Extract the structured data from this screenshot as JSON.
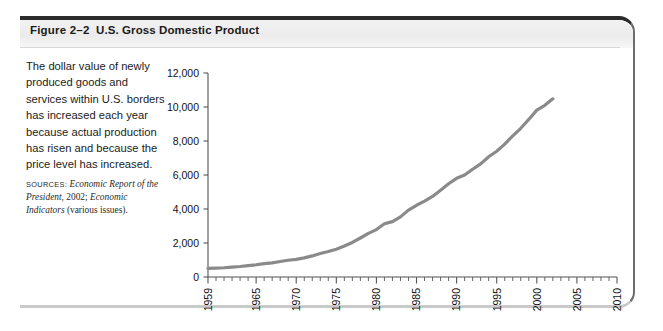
{
  "figure": {
    "number_label": "Figure 2–2",
    "title": "U.S. Gross Domestic Product",
    "caption": "The dollar value of newly produced goods and services within U.S. borders has increased each year because actual production has risen and because the price level has increased.",
    "sources_label": "SOURCES:",
    "sources_text_1": "Economic Report of the President",
    "sources_text_2": ", 2002; ",
    "sources_text_3": "Economic Indicators",
    "sources_text_4": " (various issues)."
  },
  "colors": {
    "line": "#8a8a8a",
    "axis": "#555555",
    "frame_top": "#2b2b2b",
    "header_band": "#efefef",
    "text": "#1a1a1a"
  },
  "chart_data": {
    "type": "line",
    "title": "U.S. Gross Domestic Product",
    "xlabel": "",
    "ylabel": "",
    "ylim": [
      0,
      12000
    ],
    "xlim": [
      1959,
      2010
    ],
    "grid": false,
    "legend": "none",
    "ytick_labels": [
      "12,000",
      "10,000",
      "8,000",
      "6,000",
      "4,000",
      "2,000",
      "0"
    ],
    "ytick_values": [
      12000,
      10000,
      8000,
      6000,
      4000,
      2000,
      0
    ],
    "xtick_labels": [
      "1959",
      "1965",
      "1970",
      "1975",
      "1980",
      "1985",
      "1990",
      "1995",
      "2000",
      "2005",
      "2010"
    ],
    "xtick_values": [
      1959,
      1965,
      1970,
      1975,
      1980,
      1985,
      1990,
      1995,
      2000,
      2005,
      2010
    ],
    "minor_tick_interval": 1,
    "series": [
      {
        "name": "GDP (billions of dollars)",
        "x": [
          1959,
          1960,
          1961,
          1962,
          1963,
          1964,
          1965,
          1966,
          1967,
          1968,
          1969,
          1970,
          1971,
          1972,
          1973,
          1974,
          1975,
          1976,
          1977,
          1978,
          1979,
          1980,
          1981,
          1982,
          1983,
          1984,
          1985,
          1986,
          1987,
          1988,
          1989,
          1990,
          1991,
          1992,
          1993,
          1994,
          1995,
          1996,
          1997,
          1998,
          1999,
          2000,
          2001,
          2002
        ],
        "values": [
          507,
          527,
          545,
          586,
          618,
          664,
          720,
          788,
          833,
          910,
          985,
          1039,
          1128,
          1240,
          1386,
          1501,
          1635,
          1824,
          2031,
          2295,
          2563,
          2790,
          3128,
          3255,
          3537,
          3933,
          4220,
          4463,
          4740,
          5104,
          5484,
          5803,
          5996,
          6338,
          6657,
          7072,
          7398,
          7817,
          8304,
          8747,
          9268,
          9817,
          10101,
          10480
        ]
      }
    ]
  }
}
